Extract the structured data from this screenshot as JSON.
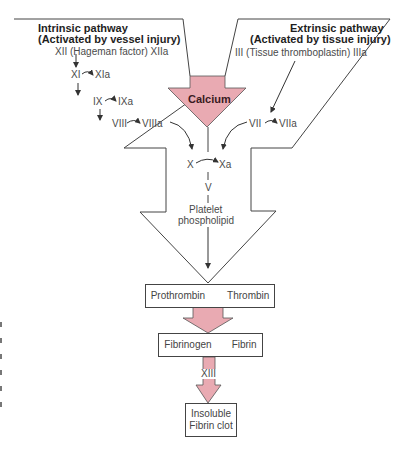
{
  "colors": {
    "arrow_fill": "#e9aab2",
    "outline": "#444444",
    "text": "#4a4a4a"
  },
  "intrinsic": {
    "title": "Intrinsic pathway",
    "subtitle": "(Activated by vessel injury)",
    "factors": [
      {
        "from": "XII (Hageman factor)",
        "to": "XIIa"
      },
      {
        "from": "XI",
        "to": "XIa"
      },
      {
        "from": "IX",
        "to": "IXa"
      },
      {
        "from": "VIII",
        "to": "VIIIa"
      }
    ]
  },
  "extrinsic": {
    "title": "Extrinsic pathway",
    "subtitle": "(Activated by tissue injury)",
    "factors": [
      {
        "from": "III (Tissue thromboplastin)",
        "to": "IIIa"
      },
      {
        "from": "VII",
        "to": "VIIa"
      }
    ]
  },
  "calcium": "Calcium",
  "common": {
    "x_from": "X",
    "x_to": "Xa",
    "factor_v": "V",
    "platelet": "Platelet",
    "phospholipid": "phospholipid"
  },
  "boxes": {
    "prothrombin": "Prothrombin",
    "thrombin": "Thrombin",
    "fibrinogen": "Fibrinogen",
    "fibrin": "Fibrin",
    "factor_xiii": "XIII",
    "clot_line1": "Insoluble",
    "clot_line2": "Fibrin clot"
  }
}
